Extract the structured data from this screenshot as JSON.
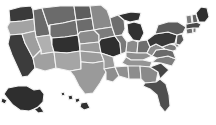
{
  "map": {
    "title": "United States choropleth map",
    "projection": "albers-usa",
    "background_color": "#ffffff",
    "border_color": "#f2f2f2",
    "legend_visible": false,
    "labels_visible": false,
    "insets": [
      "Alaska",
      "Hawaii"
    ],
    "palette": {
      "very_light": "#bfbfbf",
      "light": "#a8a8a8",
      "medium": "#8f8f8f",
      "medium_dark": "#6e6e6e",
      "dark": "#4a4a4a",
      "very_dark": "#2e2e2e"
    },
    "shade_bins": [
      {
        "name": "very_light",
        "color": "#bfbfbf"
      },
      {
        "name": "light",
        "color": "#a8a8a8"
      },
      {
        "name": "medium",
        "color": "#8f8f8f"
      },
      {
        "name": "medium_dark",
        "color": "#6e6e6e"
      },
      {
        "name": "dark",
        "color": "#4a4a4a"
      },
      {
        "name": "very_dark",
        "color": "#2e2e2e"
      }
    ],
    "states": [
      {
        "id": "WA",
        "name": "Washington",
        "color": "#3a3a3a"
      },
      {
        "id": "OR",
        "name": "Oregon",
        "color": "#a3a3a3"
      },
      {
        "id": "CA",
        "name": "California",
        "color": "#3c3c3c"
      },
      {
        "id": "ID",
        "name": "Idaho",
        "color": "#6a6a6a"
      },
      {
        "id": "NV",
        "name": "Nevada",
        "color": "#9e9e9e"
      },
      {
        "id": "UT",
        "name": "Utah",
        "color": "#b0b0b0"
      },
      {
        "id": "AZ",
        "name": "Arizona",
        "color": "#a0a0a0"
      },
      {
        "id": "MT",
        "name": "Montana",
        "color": "#6b6b6b"
      },
      {
        "id": "WY",
        "name": "Wyoming",
        "color": "#6f6f6f"
      },
      {
        "id": "CO",
        "name": "Colorado",
        "color": "#303030"
      },
      {
        "id": "NM",
        "name": "New Mexico",
        "color": "#a5a5a5"
      },
      {
        "id": "ND",
        "name": "North Dakota",
        "color": "#5e5e5e"
      },
      {
        "id": "SD",
        "name": "South Dakota",
        "color": "#6c6c6c"
      },
      {
        "id": "NE",
        "name": "Nebraska",
        "color": "#8c8c8c"
      },
      {
        "id": "KS",
        "name": "Kansas",
        "color": "#9a9a9a"
      },
      {
        "id": "OK",
        "name": "Oklahoma",
        "color": "#9c9c9c"
      },
      {
        "id": "TX",
        "name": "Texas",
        "color": "#9a9a9a"
      },
      {
        "id": "MN",
        "name": "Minnesota",
        "color": "#8a8a8a"
      },
      {
        "id": "IA",
        "name": "Iowa",
        "color": "#7c7c7c"
      },
      {
        "id": "MO",
        "name": "Missouri",
        "color": "#2f2f2f"
      },
      {
        "id": "AR",
        "name": "Arkansas",
        "color": "#9b9b9b"
      },
      {
        "id": "LA",
        "name": "Louisiana",
        "color": "#8e8e8e"
      },
      {
        "id": "WI",
        "name": "Wisconsin",
        "color": "#6e6e6e"
      },
      {
        "id": "IL",
        "name": "Illinois",
        "color": "#7a7a7a"
      },
      {
        "id": "MI",
        "name": "Michigan",
        "color": "#313131"
      },
      {
        "id": "IN",
        "name": "Indiana",
        "color": "#8b8b8b"
      },
      {
        "id": "OH",
        "name": "Ohio",
        "color": "#6d6d6d"
      },
      {
        "id": "KY",
        "name": "Kentucky",
        "color": "#8f8f8f"
      },
      {
        "id": "TN",
        "name": "Tennessee",
        "color": "#949494"
      },
      {
        "id": "MS",
        "name": "Mississippi",
        "color": "#909090"
      },
      {
        "id": "AL",
        "name": "Alabama",
        "color": "#8d8d8d"
      },
      {
        "id": "GA",
        "name": "Georgia",
        "color": "#8a8a8a"
      },
      {
        "id": "FL",
        "name": "Florida",
        "color": "#4e4e4e"
      },
      {
        "id": "SC",
        "name": "South Carolina",
        "color": "#454545"
      },
      {
        "id": "NC",
        "name": "North Carolina",
        "color": "#7e7e7e"
      },
      {
        "id": "VA",
        "name": "Virginia",
        "color": "#6a6a6a"
      },
      {
        "id": "WV",
        "name": "West Virginia",
        "color": "#8c8c8c"
      },
      {
        "id": "MD",
        "name": "Maryland",
        "color": "#7a7a7a"
      },
      {
        "id": "DE",
        "name": "Delaware",
        "color": "#8f8f8f"
      },
      {
        "id": "PA",
        "name": "Pennsylvania",
        "color": "#383838"
      },
      {
        "id": "NJ",
        "name": "New Jersey",
        "color": "#5a5a5a"
      },
      {
        "id": "NY",
        "name": "New York",
        "color": "#5c5c5c"
      },
      {
        "id": "CT",
        "name": "Connecticut",
        "color": "#6e6e6e"
      },
      {
        "id": "RI",
        "name": "Rhode Island",
        "color": "#7a7a7a"
      },
      {
        "id": "MA",
        "name": "Massachusetts",
        "color": "#4a4a4a"
      },
      {
        "id": "VT",
        "name": "Vermont",
        "color": "#7d7d7d"
      },
      {
        "id": "NH",
        "name": "New Hampshire",
        "color": "#636363"
      },
      {
        "id": "ME",
        "name": "Maine",
        "color": "#2f2f2f"
      },
      {
        "id": "AK",
        "name": "Alaska",
        "color": "#2e2e2e"
      },
      {
        "id": "HI",
        "name": "Hawaii",
        "color": "#303030"
      }
    ]
  }
}
